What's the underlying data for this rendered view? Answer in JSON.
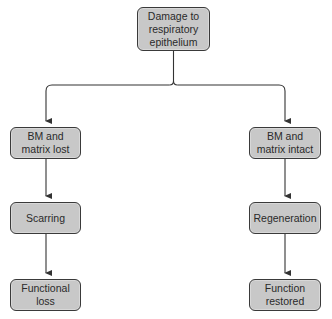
{
  "diagram": {
    "type": "flowchart",
    "colors": {
      "node_fill": "#c8c8c8",
      "node_border": "#3a3a3a",
      "line": "#333333",
      "text": "#2a2a2a"
    },
    "root": {
      "label": "Damage to\nrespiratory\nepithelium"
    },
    "branches": [
      {
        "side": "left",
        "nodes": [
          {
            "label": "BM and\nmatrix lost"
          },
          {
            "label": "Scarring"
          },
          {
            "label": "Functional\nloss"
          }
        ]
      },
      {
        "side": "right",
        "nodes": [
          {
            "label": "BM and\nmatrix intact"
          },
          {
            "label": "Regeneration"
          },
          {
            "label": "Function\nrestored"
          }
        ]
      }
    ]
  }
}
